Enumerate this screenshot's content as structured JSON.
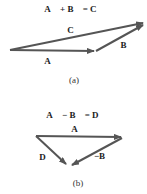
{
  "panel_a": {
    "equation": "A⃗ + B⃗ = C⃗",
    "vectors": [
      {
        "name": "A",
        "label": "A⃗"
      },
      {
        "name": "B",
        "label": "B⃗"
      },
      {
        "name": "C",
        "label": "C⃗"
      }
    ],
    "caption": "(a)"
  },
  "panel_b": {
    "equation": "A⃗ − B⃗ = D⃗",
    "vectors": [
      {
        "name": "A",
        "label": "A⃗"
      },
      {
        "name": "D",
        "label": "D⃗"
      },
      {
        "name": "-B",
        "label": "−B⃗"
      }
    ],
    "caption": "(b)"
  },
  "colors": {
    "arrow": "#555555",
    "text": "#222222"
  }
}
